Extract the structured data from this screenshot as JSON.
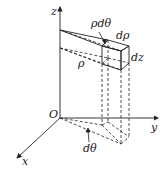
{
  "diagram": {
    "type": "cylindrical-volume-element",
    "axes": {
      "z": "z",
      "y": "y",
      "x": "x",
      "origin": "O"
    },
    "labels": {
      "rho_dtheta": "ρdθ",
      "drho": "dρ",
      "dz": "dz",
      "rho": "ρ",
      "dtheta": "dθ"
    },
    "colors": {
      "line": "#222222",
      "background": "#ffffff"
    }
  }
}
